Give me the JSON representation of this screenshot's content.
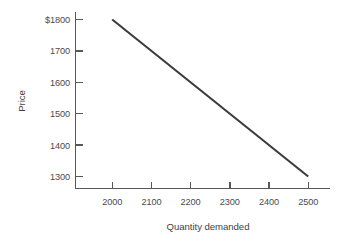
{
  "chart_data": {
    "type": "line",
    "title": "",
    "xlabel": "Quantity demanded",
    "ylabel": "Price",
    "x": [
      2000,
      2100,
      2200,
      2300,
      2400,
      2500
    ],
    "series": [
      {
        "name": "Demand",
        "x": [
          2000,
          2500
        ],
        "values": [
          1800,
          1300
        ]
      }
    ],
    "xticks": [
      2000,
      2100,
      2200,
      2300,
      2400,
      2500
    ],
    "xtick_labels": [
      "2000",
      "2100",
      "2200",
      "2300",
      "2400",
      "2500"
    ],
    "yticks": [
      1300,
      1400,
      1500,
      1600,
      1700,
      1800
    ],
    "ytick_labels": [
      "1300",
      "1400",
      "1500",
      "1600",
      "1700",
      "$1800"
    ],
    "xlim": [
      1950,
      2560
    ],
    "ylim": [
      1240,
      1820
    ],
    "grid": false,
    "legend": "none",
    "line_color": "#3b3b3d",
    "axis_color": "#58585a",
    "text_color": "#4a4a4c",
    "background_color": "#ffffff"
  }
}
